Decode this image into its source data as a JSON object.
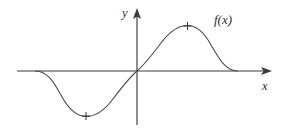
{
  "figure": {
    "background_color": "#ffffff",
    "ink_color": "#3b3b3b",
    "curve_color": "#4a4a4a",
    "width": 286,
    "height": 131
  },
  "labels": {
    "y_axis": "y",
    "x_axis": "x",
    "function": "f(x)"
  },
  "chart_data": {
    "type": "line",
    "title": "",
    "xlabel": "x",
    "ylabel": "y",
    "series": [
      {
        "name": "f(x)",
        "description": "sine-like wave: one full period, negative half-cycle left of origin, positive half-cycle right of origin",
        "x": [
          -3.14159,
          -2.74889,
          -2.35619,
          -1.9635,
          -1.5708,
          -1.1781,
          -0.7854,
          -0.3927,
          0,
          0.3927,
          0.7854,
          1.1781,
          1.5708,
          1.9635,
          2.35619,
          2.74889,
          3.14159
        ],
        "y": [
          0,
          -0.38268,
          -0.70711,
          -0.92388,
          -1,
          -0.92388,
          -0.70711,
          -0.38268,
          0,
          0.38268,
          0.70711,
          0.92388,
          1,
          0.92388,
          0.70711,
          0.38268,
          0
        ]
      }
    ],
    "xlim": [
      -3.14159,
      3.14159
    ],
    "ylim": [
      -1,
      1
    ],
    "grid": false,
    "legend": "none",
    "annotations": [
      {
        "name": "maximum-tick",
        "x": 1.5708,
        "y": 1,
        "marker": "plus"
      },
      {
        "name": "minimum-tick",
        "x": -1.5708,
        "y": -1,
        "marker": "plus"
      }
    ],
    "axes": {
      "x_axis_arrow": true,
      "y_axis_arrow": true,
      "x_axis_pixel_y": 71,
      "y_axis_pixel_x": 137,
      "origin_pixel": [
        137,
        71
      ]
    }
  },
  "geometry": {
    "x_axis": {
      "x1": 17,
      "y1": 71,
      "x2": 268,
      "y2": 71
    },
    "y_axis": {
      "x1": 137,
      "y1": 14,
      "x2": 137,
      "y2": 125
    },
    "curve_path": "M 35.5 71 C 49 71 56 86 62 97 C 70 111 78 116.5 86 116.5 C 94 116.5 104 111 113 99 C 122 87 129 78 137 71 C 145 64 152 55 161 43 C 170 31 180 25.5 187.5 25.5 C 195 25.5 203.5 31 211 45 C 218 56 224.5 71 237.5 71",
    "peak_tick": {
      "cx": 187.5,
      "cy": 26,
      "half": 4
    },
    "trough_tick": {
      "cx": 86,
      "cy": 116,
      "half": 4
    },
    "y_label_pos": {
      "x": 122,
      "y": 17
    },
    "x_label_pos": {
      "x": 262,
      "y": 90
    },
    "func_label_pos": {
      "x": 214,
      "y": 24
    }
  }
}
